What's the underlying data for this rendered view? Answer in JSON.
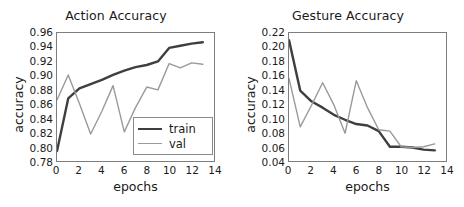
{
  "figure": {
    "width": 464,
    "height": 207,
    "background": "#ffffff"
  },
  "colors": {
    "train": "#3f3f3f",
    "val": "#9a9a9a",
    "axis": "#7d7d7d",
    "text": "#1a1a1a"
  },
  "chart_data": [
    {
      "type": "line",
      "title": "Action Accuracy",
      "xlabel": "epochs",
      "ylabel": "accuracy",
      "xlim": [
        0,
        14
      ],
      "ylim": [
        0.78,
        0.96
      ],
      "xticks": [
        0,
        2,
        4,
        6,
        8,
        10,
        12,
        14
      ],
      "yticks": [
        0.78,
        0.8,
        0.82,
        0.84,
        0.86,
        0.88,
        0.9,
        0.92,
        0.94,
        0.96
      ],
      "ytick_labels": [
        "0.78",
        "0.80",
        "0.82",
        "0.84",
        "0.86",
        "0.88",
        "0.90",
        "0.92",
        "0.94",
        "0.96"
      ],
      "xtick_labels": [
        "0",
        "2",
        "4",
        "6",
        "8",
        "10",
        "12",
        "14"
      ],
      "grid": false,
      "legend_position": "lower right",
      "x": [
        0,
        1,
        2,
        3,
        4,
        5,
        6,
        7,
        8,
        9,
        10,
        11,
        12,
        13
      ],
      "series": [
        {
          "name": "train",
          "color": "#3f3f3f",
          "width": 2.4,
          "values": [
            0.794,
            0.868,
            0.882,
            0.888,
            0.894,
            0.901,
            0.907,
            0.912,
            0.915,
            0.92,
            0.939,
            0.942,
            0.945,
            0.947
          ]
        },
        {
          "name": "val",
          "color": "#9a9a9a",
          "width": 1.4,
          "values": [
            0.866,
            0.901,
            0.861,
            0.818,
            0.85,
            0.886,
            0.821,
            0.855,
            0.884,
            0.88,
            0.917,
            0.911,
            0.918,
            0.916
          ]
        }
      ]
    },
    {
      "type": "line",
      "title": "Gesture Accuracy",
      "xlabel": "epochs",
      "ylabel": "accuracy",
      "xlim": [
        0,
        14
      ],
      "ylim": [
        0.04,
        0.22
      ],
      "xticks": [
        0,
        2,
        4,
        6,
        8,
        10,
        12,
        14
      ],
      "yticks": [
        0.04,
        0.06,
        0.08,
        0.1,
        0.12,
        0.14,
        0.16,
        0.18,
        0.2,
        0.22
      ],
      "ytick_labels": [
        "0.04",
        "0.06",
        "0.08",
        "0.10",
        "0.12",
        "0.14",
        "0.16",
        "0.18",
        "0.20",
        "0.22"
      ],
      "xtick_labels": [
        "0",
        "2",
        "4",
        "6",
        "8",
        "10",
        "12",
        "14"
      ],
      "grid": false,
      "legend_position": "none",
      "x": [
        0,
        1,
        2,
        3,
        4,
        5,
        6,
        7,
        8,
        9,
        10,
        11,
        12,
        13
      ],
      "series": [
        {
          "name": "train",
          "color": "#3f3f3f",
          "width": 2.4,
          "values": [
            0.21,
            0.139,
            0.124,
            0.115,
            0.105,
            0.098,
            0.092,
            0.09,
            0.082,
            0.06,
            0.06,
            0.059,
            0.056,
            0.055
          ]
        },
        {
          "name": "val",
          "color": "#9a9a9a",
          "width": 1.4,
          "values": [
            0.156,
            0.088,
            0.118,
            0.15,
            0.119,
            0.079,
            0.153,
            0.115,
            0.084,
            0.082,
            0.06,
            0.059,
            0.06,
            0.064
          ]
        }
      ]
    }
  ],
  "legend": {
    "items": [
      {
        "label": "train",
        "color": "#3f3f3f",
        "width": 2.4
      },
      {
        "label": "val",
        "color": "#9a9a9a",
        "width": 1.4
      }
    ]
  }
}
